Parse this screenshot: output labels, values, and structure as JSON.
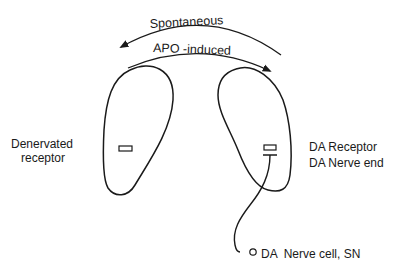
{
  "arrows": {
    "spontaneous": {
      "label": "Spontaneous",
      "direction": "right-to-left"
    },
    "apo_induced": {
      "label": "APO -induced",
      "direction": "left-to-right"
    }
  },
  "left_structure": {
    "label_line1": "Denervated",
    "label_line2": "receptor"
  },
  "right_structure": {
    "label_line1": "DA Receptor",
    "label_line2": "DA Nerve end"
  },
  "nerve_cell": {
    "label": "DA  Nerve cell, SN"
  },
  "colors": {
    "ink": "#1a1a1a",
    "background": "#ffffff"
  }
}
